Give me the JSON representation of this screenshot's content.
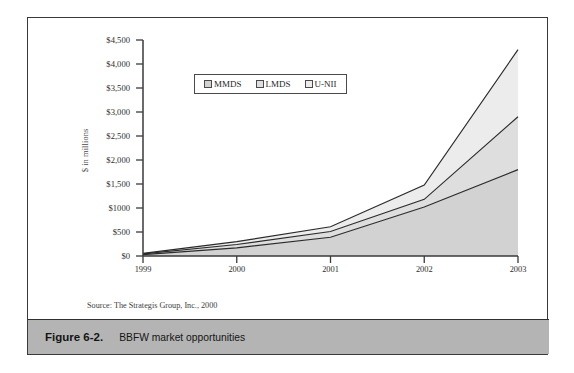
{
  "figure": {
    "caption_number": "Figure 6-2.",
    "caption_text": "BBFW market opportunities",
    "source_note": "Source: The Strategis Group, Inc., 2000"
  },
  "legend": {
    "position": "inside-top-left",
    "entries": [
      {
        "label": "MMDS",
        "color": "#d2d2d2"
      },
      {
        "label": "LMDS",
        "color": "#dedede"
      },
      {
        "label": "U-NII",
        "color": "#ececec"
      }
    ]
  },
  "chart_data": {
    "type": "area",
    "stacked": true,
    "title": "BBFW market opportunities",
    "xlabel": "",
    "ylabel": "$ in millions",
    "categories": [
      "1999",
      "2000",
      "2001",
      "2002",
      "2003"
    ],
    "x_tick_labels": [
      "1999",
      "2000",
      "2001",
      "2002",
      "2003"
    ],
    "y_tick_labels": [
      "$0",
      "$500",
      "$1000",
      "$1,500",
      "$2,000",
      "$2,500",
      "$3,000",
      "$3,500",
      "$4,000",
      "$4,500"
    ],
    "y_tick_values": [
      0,
      500,
      1000,
      1500,
      2000,
      2500,
      3000,
      3500,
      4000,
      4500
    ],
    "ylim": [
      0,
      4500
    ],
    "grid": false,
    "series": [
      {
        "name": "MMDS",
        "color": "#d2d2d2",
        "values": [
          30,
          170,
          390,
          1020,
          1800
        ]
      },
      {
        "name": "LMDS",
        "color": "#dedede",
        "values": [
          15,
          70,
          120,
          160,
          1100
        ]
      },
      {
        "name": "U-NII",
        "color": "#ececec",
        "values": [
          10,
          60,
          100,
          300,
          1400
        ]
      }
    ],
    "cumulative_totals": [
      55,
      300,
      610,
      1480,
      4300
    ]
  }
}
